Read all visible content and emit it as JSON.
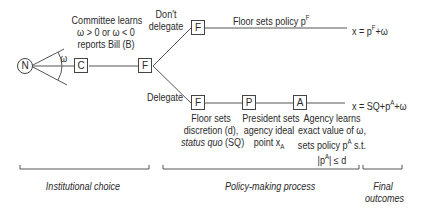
{
  "nodes": {
    "nature": "N",
    "committee": "C",
    "floor_first": "F",
    "floor_no_delegate": "F",
    "floor_delegate": "F",
    "president": "P",
    "agency": "A"
  },
  "labels": {
    "omega": "ω",
    "committee_text": [
      "Committee learns",
      "ω > 0  or ω < 0",
      "reports Bill (B)"
    ],
    "dont_delegate": [
      "Don't",
      "delegate"
    ],
    "delegate": "Delegate",
    "floor_sets_policy": "Floor sets policy p",
    "floor_sets_policy_sup": "F",
    "outcome_top": "x = p",
    "outcome_top_sup": "F",
    "outcome_top_tail": "+ω",
    "outcome_bottom": "x = SQ+p",
    "outcome_bottom_sup": "A",
    "outcome_bottom_tail": "+ω",
    "floor_discretion": [
      "Floor sets",
      "discretion (d),"
    ],
    "status_quo_italic": "status quo",
    "status_quo_tail": " (SQ)",
    "president_text": [
      "President sets",
      "agency ideal",
      "point x"
    ],
    "president_sub": "A",
    "agency_text": [
      "Agency learns",
      "exact value of ω,",
      "sets policy p"
    ],
    "agency_sup": "A",
    "agency_st": " s.t.",
    "agency_constraint": "|p",
    "agency_constraint_sup": "A",
    "agency_constraint_tail": "| ≤ d"
  },
  "phases": {
    "institutional": "Institutional choice",
    "policy": "Policy-making process",
    "final": [
      "Final",
      "outcomes"
    ]
  }
}
